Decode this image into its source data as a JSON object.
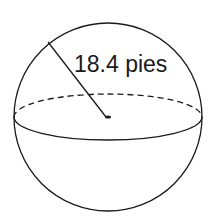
{
  "diagram": {
    "shape": "sphere",
    "radius_label": "18.4 pies",
    "stroke_color": "#1a1a1a",
    "background": "#ffffff"
  }
}
